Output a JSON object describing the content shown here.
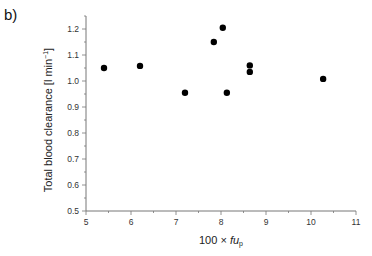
{
  "chart_data": {
    "type": "scatter",
    "panel_label": "b)",
    "title": "",
    "xlabel_prefix": "100 × ",
    "xlabel_var": "fu",
    "xlabel_sub": "p",
    "ylabel_main": "Total blood clearance [l min",
    "ylabel_sup": "−1",
    "ylabel_end": "]",
    "xlim": [
      5,
      11
    ],
    "ylim": [
      0.5,
      1.25
    ],
    "xticks": [
      "5",
      "6",
      "7",
      "8",
      "9",
      "10",
      "11"
    ],
    "yticks": [
      "0.5",
      "0.6",
      "0.7",
      "0.8",
      "0.9",
      "1.0",
      "1.1",
      "1.2"
    ],
    "grid": false,
    "points": [
      {
        "x": 5.4,
        "y": 1.05
      },
      {
        "x": 6.2,
        "y": 1.058
      },
      {
        "x": 7.2,
        "y": 0.955
      },
      {
        "x": 7.84,
        "y": 1.15
      },
      {
        "x": 8.04,
        "y": 1.205
      },
      {
        "x": 8.13,
        "y": 0.955
      },
      {
        "x": 8.64,
        "y": 1.06
      },
      {
        "x": 8.64,
        "y": 1.035
      },
      {
        "x": 10.27,
        "y": 1.008
      }
    ],
    "marker_color": "#000000"
  }
}
